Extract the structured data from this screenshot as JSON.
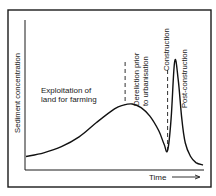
{
  "chart_data": {
    "type": "line",
    "title": "",
    "xlabel": "Time",
    "ylabel": "Sediment concentration",
    "x_ticks": [],
    "y_ticks": [],
    "grid": false,
    "legend": "none",
    "xlim": [
      0,
      100
    ],
    "ylim": [
      0,
      100
    ],
    "series": [
      {
        "name": "Sediment concentration",
        "x": [
          0,
          10,
          20,
          30,
          40,
          50,
          55,
          60,
          65,
          70,
          75,
          78,
          80,
          82,
          84,
          86,
          88,
          90,
          93,
          96,
          100
        ],
        "y": [
          7,
          10,
          15,
          23,
          35,
          46,
          49,
          50,
          47,
          40,
          28,
          17,
          12,
          38,
          85,
          70,
          38,
          18,
          7,
          2,
          0
        ]
      }
    ],
    "annotations": [
      {
        "id": "farming",
        "text_lines": [
          "Exploitation of",
          "land for farming"
        ],
        "orientation": "horizontal"
      },
      {
        "id": "dereliction",
        "text_lines": [
          "Dereliction prior",
          "to urbanisation"
        ],
        "orientation": "vertical",
        "marker_x": 56
      },
      {
        "id": "construction",
        "text_lines": [
          "Construction"
        ],
        "orientation": "vertical",
        "marker_x": 80
      },
      {
        "id": "post_construction",
        "text_lines": [
          "Post-construction"
        ],
        "orientation": "vertical"
      }
    ],
    "time_arrow": true
  }
}
